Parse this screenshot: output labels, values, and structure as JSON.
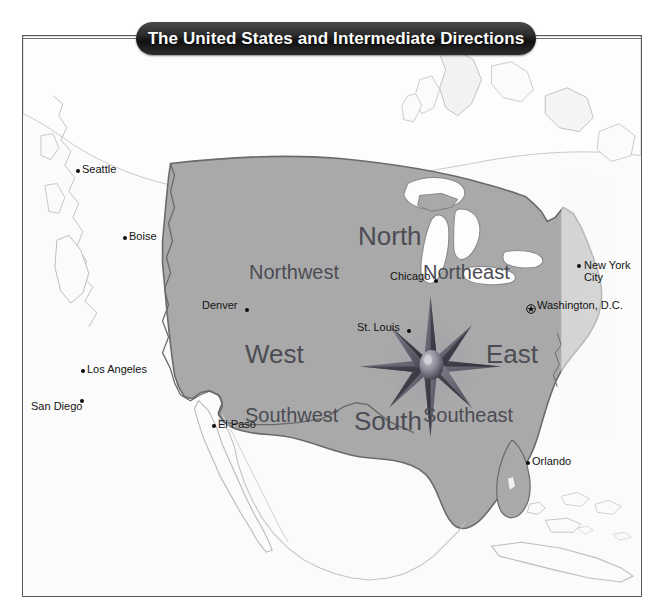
{
  "title": {
    "text": "The United States and Intermediate Directions"
  },
  "map": {
    "land_fill": "#a9a9a9",
    "land_stroke": "#6a6a6a",
    "ocean_fill": "#fbfbfb",
    "lake_fill": "#fdfdfd",
    "frame_color": "#58585c",
    "label_color": "#141414",
    "direction_color": "#4c4c54",
    "compass_color": "#53535e"
  },
  "directions": [
    {
      "id": "north",
      "label": "North",
      "size": "cardinal"
    },
    {
      "id": "northeast",
      "label": "Northeast",
      "size": "inter"
    },
    {
      "id": "east",
      "label": "East",
      "size": "cardinal"
    },
    {
      "id": "southeast",
      "label": "Southeast",
      "size": "inter"
    },
    {
      "id": "south",
      "label": "South",
      "size": "cardinal"
    },
    {
      "id": "southwest",
      "label": "Southwest",
      "size": "inter"
    },
    {
      "id": "west",
      "label": "West",
      "size": "cardinal"
    },
    {
      "id": "northwest",
      "label": "Northwest",
      "size": "inter"
    }
  ],
  "cities": [
    {
      "id": "seattle",
      "label": "Seattle",
      "marker": "dot"
    },
    {
      "id": "boise",
      "label": "Boise",
      "marker": "dot"
    },
    {
      "id": "denver",
      "label": "Denver",
      "marker": "dot"
    },
    {
      "id": "los-angeles",
      "label": "Los Angeles",
      "marker": "dot"
    },
    {
      "id": "san-diego",
      "label": "San Diego",
      "marker": "dot"
    },
    {
      "id": "el-paso",
      "label": "El Paso",
      "marker": "dot"
    },
    {
      "id": "chicago",
      "label": "Chicago",
      "marker": "dot"
    },
    {
      "id": "st-louis",
      "label": "St. Louis",
      "marker": "dot"
    },
    {
      "id": "new-york-city",
      "label": "New York",
      "label2": "City",
      "marker": "dot"
    },
    {
      "id": "washington-dc",
      "label": "Washington, D.C.",
      "marker": "capital-star"
    },
    {
      "id": "orlando",
      "label": "Orlando",
      "marker": "dot"
    }
  ]
}
